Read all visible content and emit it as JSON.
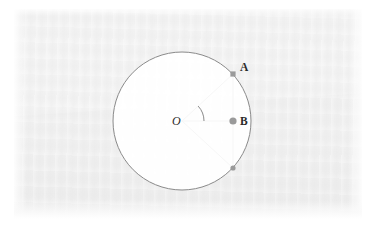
{
  "figure": {
    "kind": "geometry-diagram",
    "background_color": "#efefef",
    "page_color": "#ffffff",
    "stroke_color": "#8a8a8a",
    "marker_color": "#9a9a9a",
    "label_color": "#2b2b2b",
    "circle": {
      "name": "main-circle",
      "center_x": 182,
      "center_y": 121,
      "radius": 69,
      "stroke_width": 1
    },
    "points": [
      {
        "id": "O",
        "label": "O",
        "x": 182,
        "y": 121,
        "label_x": 172,
        "label_y": 125,
        "marker": "none",
        "label_style": "italic"
      },
      {
        "id": "A",
        "label": "A",
        "x": 233,
        "y": 74,
        "label_x": 240,
        "label_y": 71,
        "marker": "square",
        "marker_size": 5.2,
        "label_style": "bold"
      },
      {
        "id": "B",
        "label": "B",
        "x": 233,
        "y": 121,
        "label_x": 240,
        "label_y": 125,
        "marker": "circle",
        "marker_size": 3.6,
        "label_style": "bold"
      },
      {
        "id": "C",
        "label": "",
        "x": 233,
        "y": 168,
        "label_x": 240,
        "label_y": 172,
        "marker": "circle",
        "marker_size": 2.6,
        "label_style": "none"
      }
    ],
    "segments": [
      {
        "name": "radius-OA",
        "from": "O",
        "to": "A"
      },
      {
        "name": "radius-OB-horizontal",
        "from": "O",
        "to": "B"
      },
      {
        "name": "radius-OC",
        "from": "O",
        "to": "C"
      },
      {
        "name": "chord-AC",
        "from": "A",
        "to": "C"
      }
    ],
    "angle_arc": {
      "name": "angle-AOB-arc",
      "vertex": "O",
      "radius": 22,
      "start_deg": -42.6,
      "end_deg": 0
    }
  }
}
